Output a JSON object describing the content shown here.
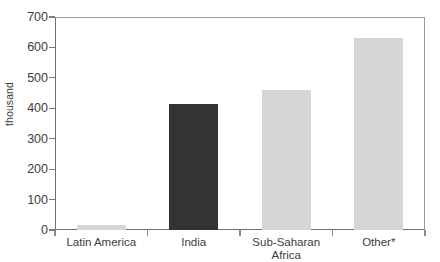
{
  "chart_data": {
    "type": "bar",
    "title": "",
    "xlabel": "",
    "ylabel": "thousand",
    "categories": [
      "Latin America",
      "India",
      "Sub-Saharan\nAfrica",
      "Other*"
    ],
    "values": [
      18,
      415,
      460,
      630
    ],
    "ylim": [
      0,
      700
    ],
    "yticks": [
      0,
      100,
      200,
      300,
      400,
      500,
      600,
      700
    ],
    "ytick_labels": [
      "0",
      "100",
      "200",
      "300",
      "400",
      "500",
      "600",
      "700"
    ],
    "grid": false,
    "legend": "none",
    "bar_colors": [
      "#d6d6d6",
      "#333333",
      "#d6d6d6",
      "#d6d6d6"
    ],
    "axis_color": "#6f6f6f",
    "text_color": "#3d3d3d",
    "background": "#ffffff"
  },
  "axes": {
    "y_title": "thousand"
  }
}
